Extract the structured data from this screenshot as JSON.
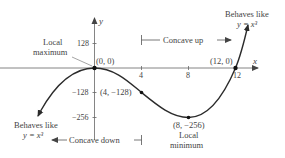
{
  "diagram": {
    "axes": {
      "x_label": "x",
      "y_label": "y",
      "x_ticks": [
        "4",
        "8",
        "12"
      ],
      "y_ticks": [
        "128",
        "−128",
        "−256"
      ]
    },
    "points": [
      {
        "label": "(0, 0)",
        "x": 0,
        "y": 0
      },
      {
        "label": "(4, −128)",
        "x": 4,
        "y": -128
      },
      {
        "label": "(8, −256)",
        "x": 8,
        "y": -256
      },
      {
        "label": "(12, 0)",
        "x": 12,
        "y": 0
      }
    ],
    "annotations": {
      "local_max_line1": "Local",
      "local_max_line2": "maximum",
      "local_min_line1": "Local",
      "local_min_line2": "minimum",
      "behaves_left_line1": "Behaves like",
      "behaves_left_line2": "y = x³",
      "behaves_right_line1": "Behaves like",
      "behaves_right_line2": "y = x³",
      "concave_up": "Concave up",
      "concave_down": "Concave down"
    },
    "colors": {
      "curve": "#2b2b2b",
      "axis": "#555555",
      "text": "#444444"
    }
  }
}
